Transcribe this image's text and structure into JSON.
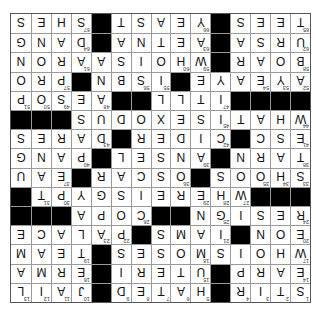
{
  "puzzle": {
    "rows": 15,
    "cols": 15,
    "display_rotation_deg": 180,
    "colors": {
      "block": "#000000",
      "cell": "#ffffff",
      "grid_line": "#9a9a9a"
    },
    "grid": [
      "STIR#HATED#JAIL",
      "EARP#UTERI#ERMA",
      "WHOISMOSES#TEAM",
      "EON#IAMS#PALACE",
      "RESIGN##COPA###",
      "###WHEREISGYPT",
      "SHOOS#OSCAR#EAU",
      "TARN#ANSEL#PANG",
      "ESC#CIDER#DARES",
      "WHATISEXODUS###",
      "####ITLL##AESOPS",
      "AYEAYE#ISBN#PRO",
      "BOAR#WHOISAARON",
      "URSA#AETNA#DANG",
      "TEES#YEAST#SHES"
    ],
    "numbers": [
      [
        1,
        2,
        3,
        4,
        null,
        5,
        6,
        7,
        8,
        9,
        null,
        10,
        11,
        12,
        13
      ],
      [
        14,
        null,
        null,
        null,
        null,
        15,
        null,
        null,
        null,
        null,
        null,
        16,
        null,
        null,
        null
      ],
      [
        17,
        null,
        null,
        null,
        null,
        18,
        null,
        null,
        null,
        null,
        null,
        19,
        null,
        null,
        null
      ],
      [
        20,
        null,
        null,
        null,
        21,
        null,
        null,
        null,
        null,
        22,
        23,
        null,
        null,
        null,
        null
      ],
      [
        24,
        null,
        null,
        null,
        25,
        null,
        null,
        null,
        26,
        null,
        null,
        null,
        null,
        null,
        null
      ],
      [
        null,
        null,
        null,
        27,
        28,
        29,
        null,
        null,
        null,
        null,
        null,
        null,
        30,
        31,
        32
      ],
      [
        33,
        34,
        35,
        null,
        null,
        null,
        36,
        null,
        null,
        null,
        null,
        null,
        37,
        null,
        null
      ],
      [
        38,
        null,
        null,
        null,
        null,
        39,
        null,
        null,
        null,
        null,
        null,
        40,
        null,
        null,
        null
      ],
      [
        41,
        null,
        null,
        null,
        42,
        null,
        null,
        null,
        null,
        null,
        43,
        null,
        null,
        null,
        null
      ],
      [
        44,
        null,
        null,
        null,
        45,
        null,
        null,
        null,
        null,
        null,
        null,
        null,
        46,
        null,
        null
      ],
      [
        null,
        null,
        null,
        null,
        47,
        null,
        null,
        null,
        null,
        null,
        48,
        null,
        49,
        50,
        51
      ],
      [
        52,
        53,
        54,
        null,
        null,
        null,
        null,
        55,
        56,
        null,
        null,
        null,
        57,
        null,
        null
      ],
      [
        58,
        null,
        null,
        null,
        null,
        59,
        60,
        null,
        null,
        null,
        null,
        61,
        null,
        null,
        null
      ],
      [
        62,
        null,
        null,
        null,
        null,
        63,
        null,
        null,
        null,
        null,
        null,
        64,
        null,
        null,
        null
      ],
      [
        65,
        null,
        null,
        null,
        null,
        66,
        null,
        null,
        null,
        null,
        null,
        67,
        null,
        null,
        null
      ]
    ]
  }
}
